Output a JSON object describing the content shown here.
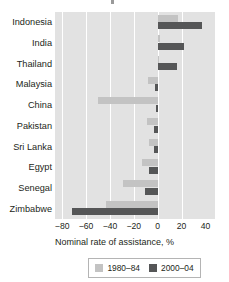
{
  "chart_data": {
    "type": "bar",
    "orientation": "horizontal",
    "title": "",
    "xlabel": "Nominal rate of assistance, %",
    "ylabel": "",
    "categories": [
      "Indonesia",
      "India",
      "Thailand",
      "Malaysia",
      "China",
      "Pakistan",
      "Sri Lanka",
      "Egypt",
      "Senegal",
      "Zimbabwe"
    ],
    "series": [
      {
        "name": "1980–84",
        "color": "#c3c3c3",
        "values": [
          17,
          2,
          0,
          -8,
          -50,
          -9,
          -7,
          -13,
          -29,
          -43
        ]
      },
      {
        "name": "2000–04",
        "color": "#555657",
        "values": [
          37,
          22,
          16,
          -2,
          -1,
          -3,
          -3,
          -7,
          -11,
          -72
        ]
      }
    ],
    "xticks": [
      -80,
      -60,
      -40,
      -20,
      0,
      20,
      40
    ],
    "xticklabels": [
      "−80",
      "−60",
      "−40",
      "−20",
      "0",
      "20",
      "40"
    ],
    "xlim": [
      -86,
      48
    ],
    "grid": true,
    "gridlines_at": [
      -80,
      -60,
      -40,
      -20,
      0,
      20
    ],
    "legend_position": "bottom",
    "plot_background": "#e2e2e2",
    "gridline_color": "#ffffff"
  }
}
